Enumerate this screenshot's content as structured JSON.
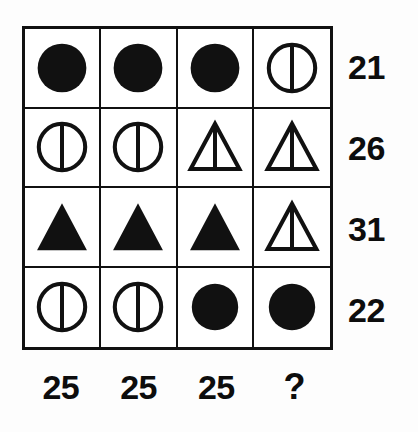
{
  "puzzle": {
    "type": "matrix-reasoning-puzzle",
    "rows": 4,
    "columns": 4,
    "shape_legend": {
      "filled-circle": "solid black circle",
      "divided-circle": "outlined circle with vertical dividing line",
      "filled-triangle": "solid black triangle",
      "divided-triangle": "outlined triangle with vertical dividing line"
    },
    "shape_values": {
      "filled-circle": 4,
      "divided-circle": 9,
      "filled-triangle": 7,
      "divided-triangle": 10
    },
    "cells": [
      [
        {
          "shape": "filled-circle",
          "name": "cell-r1c1"
        },
        {
          "shape": "filled-circle",
          "name": "cell-r1c2"
        },
        {
          "shape": "filled-circle",
          "name": "cell-r1c3"
        },
        {
          "shape": "divided-circle",
          "name": "cell-r1c4"
        }
      ],
      [
        {
          "shape": "divided-circle",
          "name": "cell-r2c1"
        },
        {
          "shape": "divided-circle",
          "name": "cell-r2c2"
        },
        {
          "shape": "divided-triangle",
          "name": "cell-r2c3"
        },
        {
          "shape": "divided-triangle",
          "name": "cell-r2c4"
        }
      ],
      [
        {
          "shape": "filled-triangle",
          "name": "cell-r3c1"
        },
        {
          "shape": "filled-triangle",
          "name": "cell-r3c2"
        },
        {
          "shape": "filled-triangle",
          "name": "cell-r3c3"
        },
        {
          "shape": "divided-triangle",
          "name": "cell-r3c4"
        }
      ],
      [
        {
          "shape": "divided-circle",
          "name": "cell-r4c1"
        },
        {
          "shape": "divided-circle",
          "name": "cell-r4c2"
        },
        {
          "shape": "filled-circle",
          "name": "cell-r4c3"
        },
        {
          "shape": "filled-circle",
          "name": "cell-r4c4"
        }
      ]
    ],
    "row_sums": [
      "21",
      "26",
      "31",
      "22"
    ],
    "column_sums": [
      "25",
      "25",
      "25",
      "?"
    ],
    "colors": {
      "ink": "#111111",
      "paper": "#ffffff",
      "text": "#0d0d0d"
    }
  }
}
